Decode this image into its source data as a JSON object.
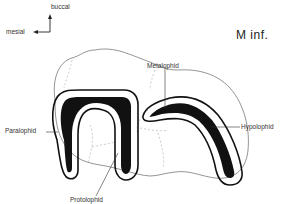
{
  "diagram": {
    "title": "M inf.",
    "orientation": {
      "vertical_label": "buccal",
      "horizontal_label": "mesial"
    },
    "labels": [
      {
        "id": "metalophid",
        "text": "Metalophid"
      },
      {
        "id": "paralophid",
        "text": "Paralophid"
      },
      {
        "id": "hypolophid",
        "text": "Hypolophid"
      },
      {
        "id": "protolophid",
        "text": "Protolophid"
      }
    ],
    "colors": {
      "ink": "#111111",
      "outline": "#555555",
      "dashed": "#aaaaaa",
      "background": "#ffffff"
    }
  }
}
